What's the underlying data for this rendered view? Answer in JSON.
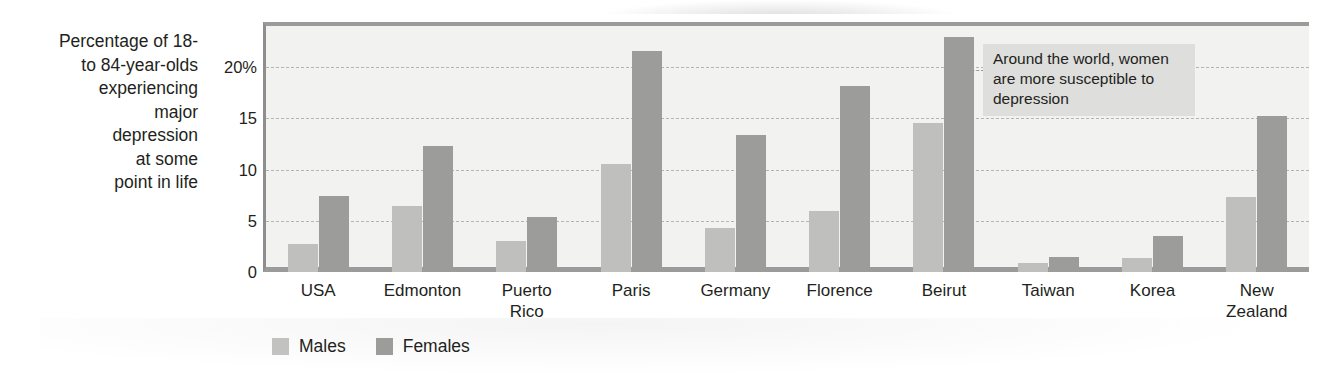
{
  "chart_data": {
    "type": "bar",
    "title": "",
    "subtitle": "",
    "ylabel": "Percentage of 18-\nto 84-year-olds\nexperiencing\nmajor\ndepression\nat some\npoint in life",
    "xlabel": "",
    "ylim": [
      0,
      24
    ],
    "yticks": [
      0,
      5,
      10,
      15,
      20
    ],
    "ytick_labels": [
      "0",
      "5",
      "10",
      "15",
      "20%"
    ],
    "grid": "horizontal-dashed",
    "legend_position": "bottom-left",
    "categories": [
      "USA",
      "Edmonton",
      "Puerto\nRico",
      "Paris",
      "Germany",
      "Florence",
      "Beirut",
      "Taiwan",
      "Korea",
      "New\nZealand"
    ],
    "series": [
      {
        "name": "Males",
        "color": "#bfbfbd",
        "values": [
          2.7,
          6.4,
          3.0,
          10.5,
          4.3,
          6.0,
          14.5,
          0.9,
          1.4,
          7.3
        ]
      },
      {
        "name": "Females",
        "color": "#9c9c9a",
        "values": [
          7.4,
          12.3,
          5.4,
          21.6,
          13.4,
          18.1,
          22.9,
          1.5,
          3.5,
          15.2
        ]
      }
    ],
    "annotations": [
      {
        "text": "Around the world, women are more susceptible to depression",
        "style": "callout-box"
      }
    ]
  },
  "colors": {
    "males": "#bfbfbd",
    "females": "#9c9c9a",
    "plot_background": "#f2f2f0",
    "axis": "#9b9b9b",
    "gridline": "#b4b4b0",
    "annotation_background": "#dededc",
    "text": "#231f20"
  }
}
